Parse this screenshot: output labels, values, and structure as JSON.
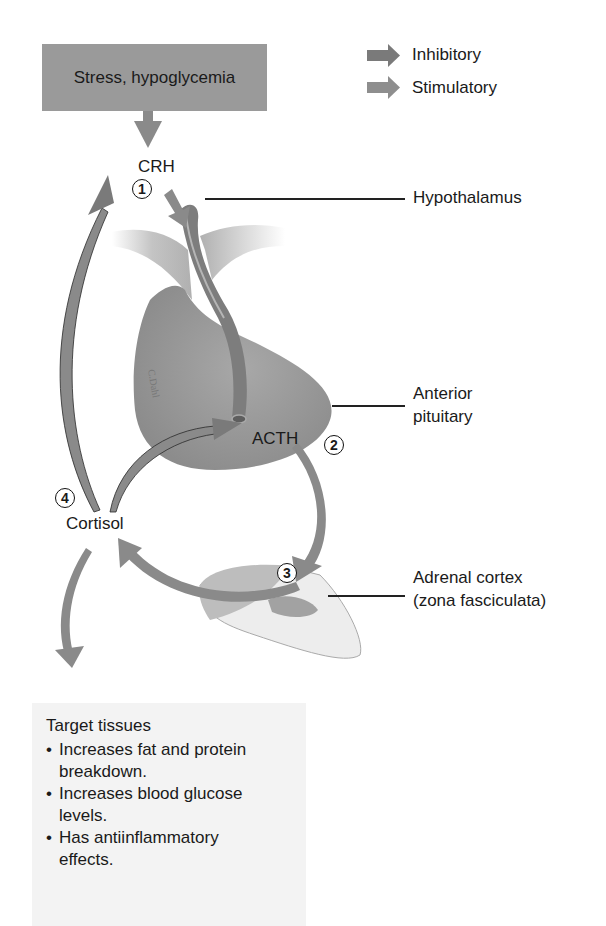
{
  "title_box": {
    "text": "Stress, hypoglycemia"
  },
  "legend": {
    "items": [
      {
        "label": "Inhibitory",
        "icon": "arrow-right-icon",
        "color": "#7a7a7a"
      },
      {
        "label": "Stimulatory",
        "icon": "arrow-right-icon",
        "color": "#8e8e8e"
      }
    ]
  },
  "hormones": {
    "crh": "CRH",
    "acth": "ACTH",
    "cortisol": "Cortisol"
  },
  "steps": [
    "1",
    "2",
    "3",
    "4"
  ],
  "structures": {
    "hypothalamus": "Hypothalamus",
    "anterior_pituitary_line1": "Anterior",
    "anterior_pituitary_line2": "pituitary",
    "adrenal_line1": "Adrenal cortex",
    "adrenal_line2": "(zona fasciculata)"
  },
  "target_tissues": {
    "heading": "Target tissues",
    "effects": [
      {
        "line1": "Increases fat and protein",
        "line2": "breakdown."
      },
      {
        "line1": "Increases blood glucose",
        "line2": "levels."
      },
      {
        "line1": "Has antiinflammatory",
        "line2": "effects."
      }
    ]
  },
  "colors": {
    "arrow": "#8a8a8a",
    "arrow_dark": "#6e6e6e",
    "gland": "#9c9c9c",
    "box": "#9a9a9a",
    "target_bg": "#f3f3f3"
  }
}
